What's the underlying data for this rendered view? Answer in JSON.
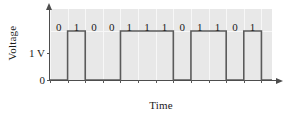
{
  "figure": {
    "type": "digital-waveform-plot",
    "background_color": "#ffffff",
    "plot_background_color": "#e8e8e8",
    "grid_color": "#f7f7f7",
    "axis_color": "#4d4d4d",
    "trace_color": "#5a5a5a"
  },
  "axes": {
    "ylabel": "Voltage",
    "xlabel": "Time",
    "yticks": [
      {
        "label": "1 V",
        "value": 1
      },
      {
        "label": "0",
        "value": 0
      }
    ]
  },
  "icons": {
    "y_axis_arrow": "arrow-up-icon",
    "x_axis_arrow": "arrow-right-icon"
  },
  "chart_data": {
    "type": "line",
    "title": "",
    "subtitle": "",
    "xlabel": "Time",
    "ylabel": "Voltage",
    "ylim": [
      0,
      1.45
    ],
    "xlim": [
      0,
      12.6
    ],
    "grid": true,
    "legend": null,
    "annotations": [
      "0",
      "1",
      "0",
      "0",
      "1",
      "1",
      "1",
      "0",
      "1",
      "1",
      "0",
      "1"
    ],
    "bit_sequence": "010011101101",
    "bit_count": 12,
    "levels": {
      "high_label": "1 V",
      "high_value": 1,
      "low_label": "0",
      "low_value": 0
    },
    "bits": [
      {
        "index": 0,
        "label": "0",
        "value": 0,
        "t_start": 0,
        "t_end": 1
      },
      {
        "index": 1,
        "label": "1",
        "value": 1,
        "t_start": 1,
        "t_end": 2
      },
      {
        "index": 2,
        "label": "0",
        "value": 0,
        "t_start": 2,
        "t_end": 3
      },
      {
        "index": 3,
        "label": "0",
        "value": 0,
        "t_start": 3,
        "t_end": 4
      },
      {
        "index": 4,
        "label": "1",
        "value": 1,
        "t_start": 4,
        "t_end": 5
      },
      {
        "index": 5,
        "label": "1",
        "value": 1,
        "t_start": 5,
        "t_end": 6
      },
      {
        "index": 6,
        "label": "1",
        "value": 1,
        "t_start": 6,
        "t_end": 7
      },
      {
        "index": 7,
        "label": "0",
        "value": 0,
        "t_start": 7,
        "t_end": 8
      },
      {
        "index": 8,
        "label": "1",
        "value": 1,
        "t_start": 8,
        "t_end": 9
      },
      {
        "index": 9,
        "label": "1",
        "value": 1,
        "t_start": 9,
        "t_end": 10
      },
      {
        "index": 10,
        "label": "0",
        "value": 0,
        "t_start": 10,
        "t_end": 11
      },
      {
        "index": 11,
        "label": "1",
        "value": 1,
        "t_start": 11,
        "t_end": 12
      }
    ],
    "x": [
      0,
      1,
      1,
      2,
      2,
      4,
      4,
      7,
      7,
      8,
      8,
      10,
      10,
      11,
      11,
      12,
      12,
      12.6
    ],
    "values": [
      0,
      0,
      1,
      1,
      0,
      0,
      1,
      1,
      0,
      0,
      1,
      1,
      0,
      0,
      1,
      1,
      0,
      0
    ]
  }
}
